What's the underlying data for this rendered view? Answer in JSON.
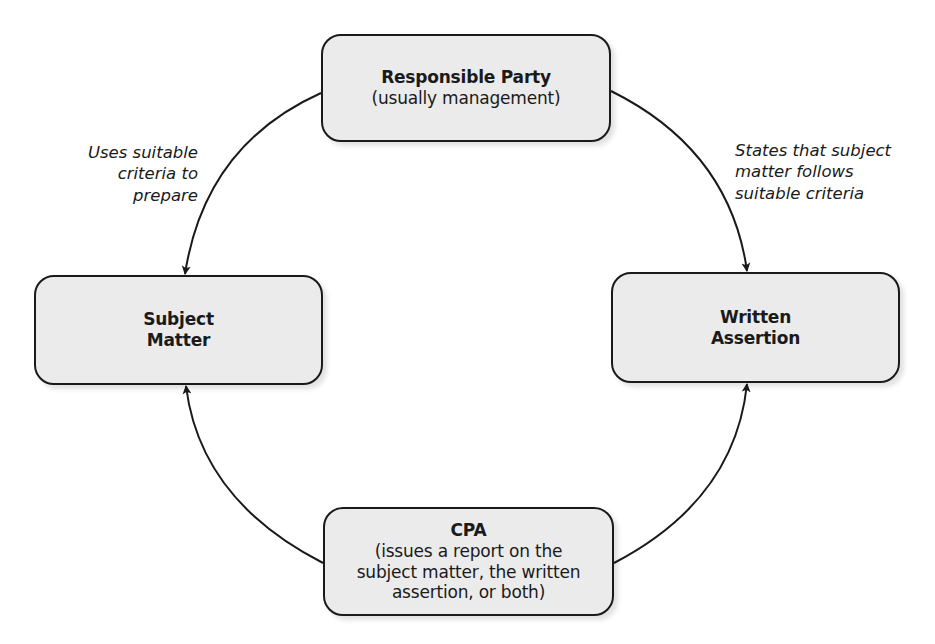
{
  "diagram": {
    "type": "cycle",
    "nodes": {
      "responsible_party": {
        "title": "Responsible Party",
        "subtitle": "(usually management)"
      },
      "subject_matter": {
        "title_line1": "Subject",
        "title_line2": "Matter"
      },
      "written_assertion": {
        "title_line1": "Written",
        "title_line2": "Assertion"
      },
      "cpa": {
        "title": "CPA",
        "subtitle_line1": "(issues a report on the",
        "subtitle_line2": "subject matter, the written",
        "subtitle_line3": "assertion, or both)"
      }
    },
    "edges": [
      {
        "from": "Responsible Party",
        "to": "Subject Matter",
        "label_lines": [
          "Uses suitable",
          "criteria to",
          "prepare"
        ]
      },
      {
        "from": "Responsible Party",
        "to": "Written Assertion",
        "label_lines": [
          "States that subject",
          "matter follows",
          "suitable criteria"
        ]
      },
      {
        "from": "CPA",
        "to": "Subject Matter",
        "label_lines": []
      },
      {
        "from": "CPA",
        "to": "Written Assertion",
        "label_lines": []
      }
    ],
    "colors": {
      "node_fill": "#ebebeb",
      "stroke": "#1a1a1a",
      "background": "#ffffff"
    }
  }
}
